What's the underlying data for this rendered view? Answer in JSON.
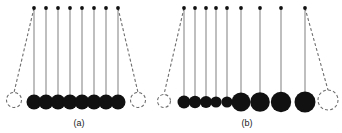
{
  "figure": {
    "type": "diagram",
    "background_color": "#ffffff",
    "ball_color": "#111111",
    "string_color": "#8a8a8a",
    "dashed_color": "#6e6e6e",
    "pivot_color": "#111111",
    "width": 342,
    "height": 133
  },
  "panels": [
    {
      "id": "panel-a",
      "label": "(a)",
      "label_x": 79,
      "label_y": 126,
      "pivot_y": 8,
      "baseline_y": 102,
      "description": "Eight identical balls of equal size hanging at rest, with one displaced ball shown dashed at left and one displaced ball shown dashed at right",
      "pivots": [
        {
          "x": 34,
          "y": 8
        },
        {
          "x": 46,
          "y": 8
        },
        {
          "x": 58,
          "y": 8
        },
        {
          "x": 70,
          "y": 8
        },
        {
          "x": 82,
          "y": 8
        },
        {
          "x": 94,
          "y": 8
        },
        {
          "x": 106,
          "y": 8
        },
        {
          "x": 118,
          "y": 8
        }
      ],
      "balls": [
        {
          "cx": 34,
          "cy": 102,
          "r": 7.5
        },
        {
          "cx": 46,
          "cy": 102,
          "r": 7.5
        },
        {
          "cx": 58,
          "cy": 102,
          "r": 7.5
        },
        {
          "cx": 70,
          "cy": 102,
          "r": 7.5
        },
        {
          "cx": 82,
          "cy": 102,
          "r": 7.5
        },
        {
          "cx": 94,
          "cy": 102,
          "r": 7.5
        },
        {
          "cx": 106,
          "cy": 102,
          "r": 7.5
        },
        {
          "cx": 118,
          "cy": 102,
          "r": 7.5
        }
      ],
      "swung": [
        {
          "id": "swung-left",
          "side": "left",
          "pivot_x": 34,
          "pivot_y": 8,
          "cx": 14,
          "cy": 100,
          "r": 7.5
        },
        {
          "id": "swung-right",
          "side": "right",
          "pivot_x": 118,
          "pivot_y": 8,
          "cx": 138,
          "cy": 100,
          "r": 7.5
        }
      ]
    },
    {
      "id": "panel-b",
      "label": "(b)",
      "label_x": 247,
      "label_y": 126,
      "pivot_y": 8,
      "baseline_y": 102,
      "description": "Nine balls of progressively increasing size hanging at rest, with one displaced small ball shown dashed at left and one displaced large ball shown dashed at right",
      "pivots": [
        {
          "x": 184,
          "y": 8
        },
        {
          "x": 195,
          "y": 8
        },
        {
          "x": 206,
          "y": 8
        },
        {
          "x": 216,
          "y": 8
        },
        {
          "x": 227,
          "y": 8
        },
        {
          "x": 241,
          "y": 8
        },
        {
          "x": 260,
          "y": 8
        },
        {
          "x": 281,
          "y": 8
        },
        {
          "x": 305,
          "y": 8
        }
      ],
      "balls": [
        {
          "cx": 184,
          "cy": 102,
          "r": 6.5
        },
        {
          "cx": 195,
          "cy": 102,
          "r": 6.2
        },
        {
          "cx": 206,
          "cy": 102,
          "r": 6.0
        },
        {
          "cx": 216,
          "cy": 102,
          "r": 5.6
        },
        {
          "cx": 227,
          "cy": 102,
          "r": 5.6
        },
        {
          "cx": 241,
          "cy": 102,
          "r": 9.5
        },
        {
          "cx": 260,
          "cy": 102,
          "r": 9.8
        },
        {
          "cx": 281,
          "cy": 102,
          "r": 10.2
        },
        {
          "cx": 305,
          "cy": 102,
          "r": 10.5
        }
      ],
      "swung": [
        {
          "id": "swung-left",
          "side": "left",
          "pivot_x": 184,
          "pivot_y": 8,
          "cx": 164,
          "cy": 101,
          "r": 6.5
        },
        {
          "id": "swung-right",
          "side": "right",
          "pivot_x": 305,
          "pivot_y": 8,
          "cx": 328,
          "cy": 100,
          "r": 10.0
        }
      ]
    }
  ]
}
